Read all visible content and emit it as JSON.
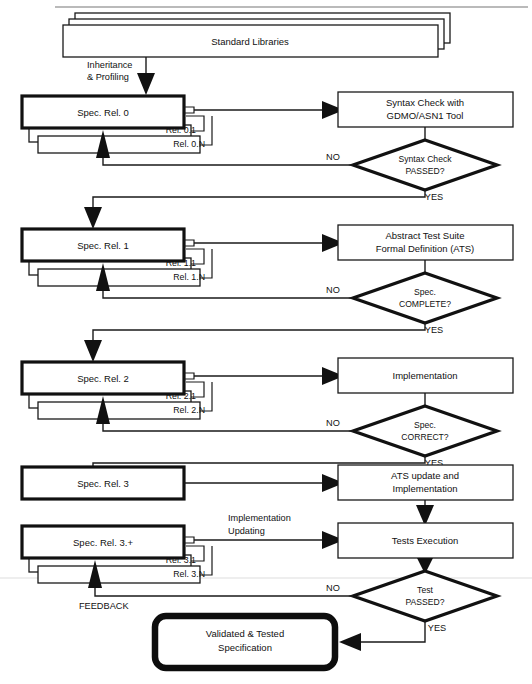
{
  "diagram": {
    "nodes": {
      "standard_libraries": "Standard Libraries",
      "inheritance_profiling_line1": "Inheritance",
      "inheritance_profiling_line2": "& Profiling",
      "spec_rel_0": "Spec. Rel. 0",
      "spec_rel_0_sub1": "Rel. 0.1",
      "spec_rel_0_subN": "Rel. 0.N",
      "syntax_check_line1": "Syntax Check with",
      "syntax_check_line2": "GDMO/ASN1 Tool",
      "decision_syntax_line1": "Syntax Check",
      "decision_syntax_line2": "PASSED?",
      "spec_rel_1": "Spec. Rel. 1",
      "spec_rel_1_sub1": "Rel. 1.1",
      "spec_rel_1_subN": "Rel. 1.N",
      "ats_line1": "Abstract Test Suite",
      "ats_line2": "Formal Definition (ATS)",
      "decision_complete_line1": "Spec.",
      "decision_complete_line2": "COMPLETE?",
      "spec_rel_2": "Spec. Rel. 2",
      "spec_rel_2_sub1": "Rel. 2.1",
      "spec_rel_2_subN": "Rel. 2.N",
      "implementation": "Implementation",
      "decision_correct_line1": "Spec.",
      "decision_correct_line2": "CORRECT?",
      "spec_rel_3": "Spec. Rel. 3",
      "ats_update_line1": "ATS update and",
      "ats_update_line2": "Implementation",
      "spec_rel_3_plus": "Spec. Rel. 3.+",
      "spec_rel_3_sub1": "Rel. 3.1",
      "spec_rel_3_subN": "Rel. 3.N",
      "implementation_updating_line1": "Implementation",
      "implementation_updating_line2": "Updating",
      "tests_execution": "Tests Execution",
      "decision_test_line1": "Test",
      "decision_test_line2": "PASSED?",
      "feedback": "FEEDBACK",
      "validated_line1": "Validated & Tested",
      "validated_line2": "Specification"
    },
    "edge_labels": {
      "no_1": "NO",
      "yes_1": "YES",
      "no_2": "NO",
      "yes_2": "YES",
      "no_3": "NO",
      "yes_3": "YES",
      "no_4": "NO",
      "yes_4": "YES"
    },
    "colors": {
      "stroke": "#111111",
      "background": "#ffffff",
      "line": "#1a1a1a"
    }
  }
}
